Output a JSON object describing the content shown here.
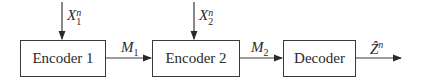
{
  "diagram": {
    "blocks": [
      {
        "id": "encoder1",
        "label": "Encoder 1"
      },
      {
        "id": "encoder2",
        "label": "Encoder 2"
      },
      {
        "id": "decoder",
        "label": "Decoder"
      }
    ],
    "inputs": [
      {
        "target": "encoder1",
        "symbol": "X",
        "sub": "1",
        "sup": "n"
      },
      {
        "target": "encoder2",
        "symbol": "X",
        "sub": "2",
        "sup": "n"
      }
    ],
    "edges": [
      {
        "from": "encoder1",
        "to": "encoder2",
        "symbol": "M",
        "sub": "1"
      },
      {
        "from": "encoder2",
        "to": "decoder",
        "symbol": "M",
        "sub": "2"
      },
      {
        "from": "decoder",
        "to": "output",
        "symbol": "Ẑ",
        "sup": "n"
      }
    ]
  }
}
